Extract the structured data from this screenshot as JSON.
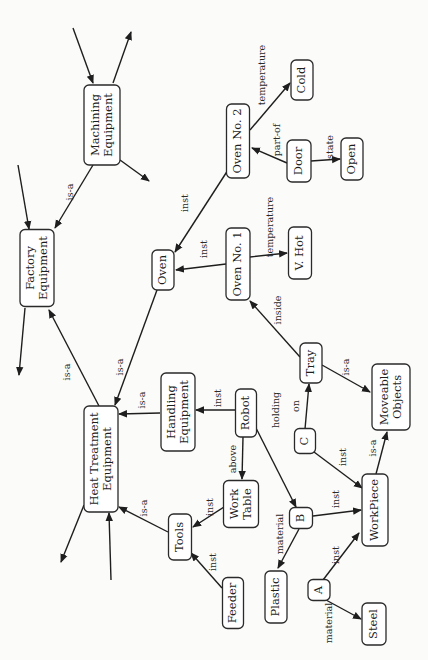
{
  "diagram": {
    "type": "semantic-network",
    "orientation": "rotated-90-ccw",
    "nodes": [
      {
        "id": "machining",
        "label": [
          "Machining",
          "Equipment"
        ],
        "cx": 102,
        "cy": 125,
        "w": 36,
        "h": 80
      },
      {
        "id": "factory",
        "label": [
          "Factory",
          "Equipment"
        ],
        "cx": 37,
        "cy": 268,
        "w": 34,
        "h": 77
      },
      {
        "id": "oven",
        "label": [
          "Oven"
        ],
        "cx": 163,
        "cy": 270,
        "w": 22,
        "h": 40
      },
      {
        "id": "oven2",
        "label": [
          "Oven No. 2"
        ],
        "cx": 238,
        "cy": 141,
        "w": 23,
        "h": 74
      },
      {
        "id": "cold",
        "label": [
          "Cold"
        ],
        "cx": 302,
        "cy": 80,
        "w": 22,
        "h": 40
      },
      {
        "id": "door",
        "label": [
          "Door"
        ],
        "cx": 299,
        "cy": 161,
        "w": 24,
        "h": 42
      },
      {
        "id": "open",
        "label": [
          "Open"
        ],
        "cx": 352,
        "cy": 159,
        "w": 22,
        "h": 42
      },
      {
        "id": "oven1",
        "label": [
          "Oven No. 1"
        ],
        "cx": 238,
        "cy": 264,
        "w": 24,
        "h": 72
      },
      {
        "id": "vhot",
        "label": [
          "V. Hot"
        ],
        "cx": 300,
        "cy": 253,
        "w": 23,
        "h": 52
      },
      {
        "id": "tray",
        "label": [
          "Tray"
        ],
        "cx": 311,
        "cy": 363,
        "w": 22,
        "h": 40
      },
      {
        "id": "moveable",
        "label": [
          "Moveable",
          "Objects"
        ],
        "cx": 391,
        "cy": 397,
        "w": 38,
        "h": 66
      },
      {
        "id": "handling",
        "label": [
          "Handling",
          "Equipment"
        ],
        "cx": 178,
        "cy": 412,
        "w": 34,
        "h": 78
      },
      {
        "id": "robot",
        "label": [
          "Robot"
        ],
        "cx": 246,
        "cy": 413,
        "w": 21,
        "h": 48
      },
      {
        "id": "heat",
        "label": [
          "Heat Treatment",
          "Equipment"
        ],
        "cx": 101,
        "cy": 459,
        "w": 34,
        "h": 106
      },
      {
        "id": "worktable",
        "label": [
          "Work",
          "Table"
        ],
        "cx": 241,
        "cy": 504,
        "w": 35,
        "h": 47
      },
      {
        "id": "c",
        "label": [
          "C"
        ],
        "cx": 305,
        "cy": 441,
        "w": 21,
        "h": 25
      },
      {
        "id": "b",
        "label": [
          "B"
        ],
        "cx": 301,
        "cy": 518,
        "w": 23,
        "h": 21
      },
      {
        "id": "tools",
        "label": [
          "Tools"
        ],
        "cx": 180,
        "cy": 537,
        "w": 23,
        "h": 46
      },
      {
        "id": "workpiece",
        "label": [
          "WorkPiece"
        ],
        "cx": 375,
        "cy": 510,
        "w": 26,
        "h": 72
      },
      {
        "id": "feeder",
        "label": [
          "Feeder"
        ],
        "cx": 233,
        "cy": 603,
        "w": 21,
        "h": 51
      },
      {
        "id": "plastic",
        "label": [
          "Plastic"
        ],
        "cx": 276,
        "cy": 597,
        "w": 22,
        "h": 52
      },
      {
        "id": "a",
        "label": [
          "A"
        ],
        "cx": 319,
        "cy": 590,
        "w": 22,
        "h": 21
      },
      {
        "id": "steel",
        "label": [
          "Steel"
        ],
        "cx": 374,
        "cy": 624,
        "w": 24,
        "h": 42
      }
    ],
    "edges": [
      {
        "from": "machining",
        "to": "factory",
        "label": "is-a",
        "x1": 93,
        "y1": 165,
        "x2": 55,
        "y2": 228,
        "lx": 70,
        "ly": 192
      },
      {
        "from": "oven2",
        "to": "oven",
        "label": "inst",
        "x1": 228,
        "y1": 170,
        "x2": 175,
        "y2": 252,
        "lx": 185,
        "ly": 203
      },
      {
        "from": "oven1",
        "to": "oven",
        "label": "inst",
        "x1": 226,
        "y1": 264,
        "x2": 176,
        "y2": 270,
        "lx": 204,
        "ly": 249
      },
      {
        "from": "oven2",
        "to": "cold",
        "label": "temperature",
        "x1": 250,
        "y1": 130,
        "x2": 290,
        "y2": 83,
        "lx": 262,
        "ly": 75
      },
      {
        "from": "door",
        "to": "oven2",
        "label": "part-of",
        "x1": 287,
        "y1": 163,
        "x2": 252,
        "y2": 148,
        "lx": 277,
        "ly": 140
      },
      {
        "from": "door",
        "to": "open",
        "label": "state",
        "x1": 311,
        "y1": 161,
        "x2": 340,
        "y2": 159,
        "lx": 330,
        "ly": 147
      },
      {
        "from": "oven1",
        "to": "vhot",
        "label": "temperature",
        "x1": 250,
        "y1": 257,
        "x2": 287,
        "y2": 253,
        "lx": 270,
        "ly": 227
      },
      {
        "from": "tray",
        "to": "oven1",
        "label": "inside",
        "x1": 300,
        "y1": 357,
        "x2": 250,
        "y2": 301,
        "lx": 278,
        "ly": 310
      },
      {
        "from": "tray",
        "to": "moveable",
        "label": "is-a",
        "x1": 322,
        "y1": 365,
        "x2": 370,
        "y2": 392,
        "lx": 346,
        "ly": 367
      },
      {
        "from": "oven",
        "to": "heat",
        "label": "is-a",
        "x1": 157,
        "y1": 290,
        "x2": 115,
        "y2": 405,
        "lx": 120,
        "ly": 367
      },
      {
        "from": "heat",
        "to": "factory",
        "label": "is-a",
        "x1": 99,
        "y1": 406,
        "x2": 49,
        "y2": 310,
        "lx": 67,
        "ly": 372
      },
      {
        "from": "handling",
        "to": "heat",
        "label": "is-a",
        "x1": 160,
        "y1": 413,
        "x2": 119,
        "y2": 414,
        "lx": 142,
        "ly": 400
      },
      {
        "from": "robot",
        "to": "handling",
        "label": "inst",
        "x1": 235,
        "y1": 410,
        "x2": 196,
        "y2": 410,
        "lx": 218,
        "ly": 398
      },
      {
        "from": "robot",
        "to": "worktable",
        "label": "above",
        "x1": 243,
        "y1": 437,
        "x2": 242,
        "y2": 479,
        "lx": 233,
        "ly": 459
      },
      {
        "from": "robot",
        "to": "b",
        "label": "holding",
        "x1": 255,
        "y1": 426,
        "x2": 296,
        "y2": 507,
        "lx": 276,
        "ly": 410
      },
      {
        "from": "worktable",
        "to": "tools",
        "label": "inst",
        "x1": 224,
        "y1": 507,
        "x2": 193,
        "y2": 527,
        "lx": 210,
        "ly": 507
      },
      {
        "from": "tools",
        "to": "heat",
        "label": "is-a",
        "x1": 168,
        "y1": 532,
        "x2": 119,
        "y2": 507,
        "lx": 144,
        "ly": 508
      },
      {
        "from": "feeder",
        "to": "tools",
        "label": "inst",
        "x1": 222,
        "y1": 588,
        "x2": 191,
        "y2": 553,
        "lx": 213,
        "ly": 562
      },
      {
        "from": "c",
        "to": "tray",
        "label": "on",
        "x1": 305,
        "y1": 429,
        "x2": 309,
        "y2": 384,
        "lx": 296,
        "ly": 406
      },
      {
        "from": "c",
        "to": "workpiece",
        "label": "inst",
        "x1": 314,
        "y1": 452,
        "x2": 362,
        "y2": 488,
        "lx": 343,
        "ly": 457
      },
      {
        "from": "workpiece",
        "to": "moveable",
        "label": "is-a",
        "x1": 376,
        "y1": 474,
        "x2": 387,
        "y2": 432,
        "lx": 373,
        "ly": 448
      },
      {
        "from": "b",
        "to": "workpiece",
        "label": "inst",
        "x1": 313,
        "y1": 516,
        "x2": 361,
        "y2": 510,
        "lx": 336,
        "ly": 499
      },
      {
        "from": "b",
        "to": "plastic",
        "label": "material",
        "x1": 299,
        "y1": 529,
        "x2": 278,
        "y2": 568,
        "lx": 280,
        "ly": 534
      },
      {
        "from": "a",
        "to": "workpiece",
        "label": "inst",
        "x1": 323,
        "y1": 580,
        "x2": 359,
        "y2": 533,
        "lx": 336,
        "ly": 555
      },
      {
        "from": "a",
        "to": "steel",
        "label": "material",
        "x1": 326,
        "y1": 600,
        "x2": 361,
        "y2": 619,
        "lx": 329,
        "ly": 623
      }
    ],
    "stubs": [
      {
        "x1": 73,
        "y1": 28,
        "x2": 93,
        "y2": 83,
        "arrow": true
      },
      {
        "x1": 113,
        "y1": 83,
        "x2": 131,
        "y2": 32,
        "arrow": true
      },
      {
        "x1": 120,
        "y1": 160,
        "x2": 149,
        "y2": 181,
        "arrow": true
      },
      {
        "x1": 18,
        "y1": 165,
        "x2": 29,
        "y2": 229,
        "arrow": true
      },
      {
        "x1": 25,
        "y1": 308,
        "x2": 19,
        "y2": 375,
        "arrow": true
      },
      {
        "x1": 84,
        "y1": 505,
        "x2": 61,
        "y2": 562,
        "arrow": true
      },
      {
        "x1": 111,
        "y1": 580,
        "x2": 109,
        "y2": 513,
        "arrow": true
      }
    ]
  }
}
